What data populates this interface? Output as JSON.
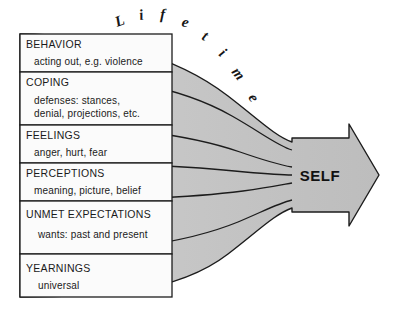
{
  "diagram": {
    "title_curved": "Lifetime",
    "title_letters": [
      "L",
      "i",
      "f",
      "e",
      "t",
      "i",
      "m",
      "e"
    ],
    "arrow_label": "SELF",
    "colors": {
      "funnel_fill": "#c7c7c7",
      "outline": "#1c1c1c",
      "box_fill": "#fbfbfb",
      "background": "#ffffff",
      "text": "#161616"
    },
    "layers": [
      {
        "category": "BEHAVIOR",
        "description": [
          "acting out, e.g. violence"
        ]
      },
      {
        "category": "COPING",
        "description": [
          "defenses: stances,",
          "denial, projections, etc."
        ]
      },
      {
        "category": "FEELINGS",
        "description": [
          "anger, hurt, fear"
        ]
      },
      {
        "category": "PERCEPTIONS",
        "description": [
          "meaning, picture, belief"
        ]
      },
      {
        "category": "UNMET  EXPECTATIONS",
        "description": [
          "wants: past and present"
        ]
      },
      {
        "category": "YEARNINGS",
        "description": [
          "universal"
        ]
      }
    ]
  }
}
